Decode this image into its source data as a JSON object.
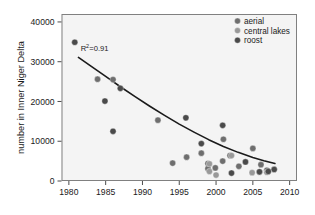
{
  "chart_data": {
    "type": "scatter",
    "title": "",
    "xlabel": "",
    "ylabel": "number in Inner Niger Delta",
    "xlim": [
      1979,
      2011
    ],
    "ylim": [
      0,
      42000
    ],
    "xticks": [
      1980,
      1985,
      1990,
      1995,
      2000,
      2005,
      2010
    ],
    "xticklabels": [
      "1980",
      "1985",
      "1990",
      "1995",
      "2000",
      "2005",
      "2010"
    ],
    "yticks": [
      0,
      10000,
      20000,
      30000,
      40000
    ],
    "yticklabels": [
      "0",
      "10000",
      "20000",
      "30000",
      "40000"
    ],
    "grid": false,
    "legend_position": "top-right",
    "annotations": [
      {
        "name": "r-squared",
        "text_prefix": "R",
        "text_sup": "2",
        "text_suffix": "=0.91",
        "x": 1981.6,
        "y": 32600
      }
    ],
    "series": [
      {
        "name": "aerial",
        "color": "#6e6e6e",
        "marker": "circle",
        "points": [
          {
            "x": 1983.9,
            "y": 25600
          },
          {
            "x": 1986.0,
            "y": 25500
          },
          {
            "x": 1992.1,
            "y": 15300
          },
          {
            "x": 1994.1,
            "y": 4500
          },
          {
            "x": 1996.0,
            "y": 6000
          },
          {
            "x": 1998.0,
            "y": 7000
          },
          {
            "x": 1998.9,
            "y": 4400
          },
          {
            "x": 1998.9,
            "y": 3100
          },
          {
            "x": 2001.0,
            "y": 10500
          },
          {
            "x": 2001.9,
            "y": 6400
          },
          {
            "x": 2003.1,
            "y": 3700
          },
          {
            "x": 2005.0,
            "y": 8200
          },
          {
            "x": 2006.1,
            "y": 4100
          },
          {
            "x": 2006.9,
            "y": 2700
          },
          {
            "x": 2000.9,
            "y": 5000
          },
          {
            "x": 1999.9,
            "y": 3300
          }
        ]
      },
      {
        "name": "central lakes",
        "color": "#999999",
        "marker": "circle",
        "points": [
          {
            "x": 1999.1,
            "y": 2400
          },
          {
            "x": 1999.1,
            "y": 4300
          },
          {
            "x": 2002.1,
            "y": 6400
          },
          {
            "x": 2004.9,
            "y": 2100
          },
          {
            "x": 2005.9,
            "y": 2200
          },
          {
            "x": 2006.9,
            "y": 2200
          },
          {
            "x": 2000.0,
            "y": 1500
          }
        ]
      },
      {
        "name": "roost",
        "color": "#4a4a4a",
        "marker": "circle",
        "points": [
          {
            "x": 1980.8,
            "y": 34900
          },
          {
            "x": 1984.9,
            "y": 20100
          },
          {
            "x": 1986.0,
            "y": 12500
          },
          {
            "x": 1987.0,
            "y": 23300
          },
          {
            "x": 1995.9,
            "y": 15900
          },
          {
            "x": 1998.0,
            "y": 9400
          },
          {
            "x": 2000.9,
            "y": 14000
          },
          {
            "x": 2002.1,
            "y": 2000
          },
          {
            "x": 2004.0,
            "y": 4800
          },
          {
            "x": 2007.9,
            "y": 2900
          },
          {
            "x": 2005.9,
            "y": 2300
          },
          {
            "x": 2007.1,
            "y": 2400
          }
        ]
      }
    ],
    "trendline": {
      "name": "exponential-fit",
      "color": "#1a1a1a",
      "width": 1.6,
      "points": [
        {
          "x": 1981.3,
          "y": 31100
        },
        {
          "x": 1983.0,
          "y": 28900
        },
        {
          "x": 1985.0,
          "y": 26300
        },
        {
          "x": 1987.0,
          "y": 23700
        },
        {
          "x": 1989.0,
          "y": 21200
        },
        {
          "x": 1991.0,
          "y": 18800
        },
        {
          "x": 1993.0,
          "y": 16500
        },
        {
          "x": 1995.0,
          "y": 14300
        },
        {
          "x": 1997.0,
          "y": 12300
        },
        {
          "x": 1999.0,
          "y": 10400
        },
        {
          "x": 2001.0,
          "y": 8700
        },
        {
          "x": 2003.0,
          "y": 7200
        },
        {
          "x": 2005.0,
          "y": 5900
        },
        {
          "x": 2006.5,
          "y": 5100
        },
        {
          "x": 2008.0,
          "y": 4400
        }
      ]
    },
    "legend": [
      {
        "label": "aerial",
        "color": "#6e6e6e"
      },
      {
        "label": "central lakes",
        "color": "#999999"
      },
      {
        "label": "roost",
        "color": "#4a4a4a"
      }
    ]
  },
  "figure": {
    "background": "#ffffff",
    "plot_background": "#f4f4f4",
    "frame_color": "#808080",
    "tick_color": "#4d4d4d"
  }
}
